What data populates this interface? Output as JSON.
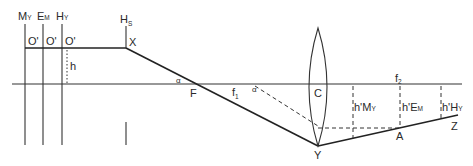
{
  "diagram": {
    "type": "optical ray diagram (lens)",
    "labels": {
      "my_main": "M",
      "my_sub": "Y",
      "em_main": "E",
      "em_sub": "M",
      "hy_main": "H",
      "hy_sub": "Y",
      "hs_main": "H",
      "hs_sub": "S",
      "o_prime_1": "O'",
      "o_prime_2": "O'",
      "o_prime_3": "O'",
      "h": "h",
      "x": "X",
      "alpha_1": "α",
      "alpha_2": "α",
      "f": "F",
      "f1_main": "f",
      "f1_sub": "1",
      "c": "C",
      "f2_main": "f",
      "f2_sub": "2",
      "hmy_main": "h'M",
      "hmy_sub": "Y",
      "hem_main": "h'E",
      "hem_sub": "M",
      "hhy_main": "h'H",
      "hhy_sub": "Y",
      "a": "A",
      "y": "Y",
      "z": "Z"
    },
    "colors": {
      "line": "#333333",
      "background": "#ffffff"
    }
  }
}
